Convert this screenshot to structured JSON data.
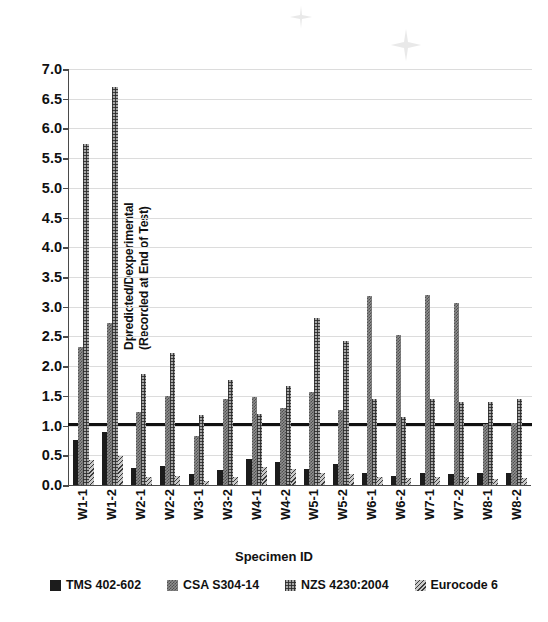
{
  "chart_data": {
    "type": "bar",
    "title": "",
    "xlabel": "Specimen ID",
    "ylabel": "Dpredicted/Dexperimental\n(Recorded at End of Test)",
    "ylim": [
      0.0,
      7.0
    ],
    "ytick_step": 0.5,
    "yticks": [
      "0.0",
      "0.5",
      "1.0",
      "1.5",
      "2.0",
      "2.5",
      "3.0",
      "3.5",
      "4.0",
      "4.5",
      "5.0",
      "5.5",
      "6.0",
      "6.5",
      "7.0"
    ],
    "grid": true,
    "legend_position": "bottom",
    "reference_line": {
      "value": 1.0,
      "color": "#111111"
    },
    "categories": [
      "W1-1",
      "W1-2",
      "W2-1",
      "W2-2",
      "W3-1",
      "W3-2",
      "W4-1",
      "W4-2",
      "W5-1",
      "W5-2",
      "W6-1",
      "W6-2",
      "W7-1",
      "W7-2",
      "W8-1",
      "W8-2"
    ],
    "series": [
      {
        "name": "TMS 402-602",
        "pattern": "solid-black",
        "values": [
          0.76,
          0.89,
          0.28,
          0.32,
          0.18,
          0.26,
          0.43,
          0.39,
          0.27,
          0.36,
          0.2,
          0.16,
          0.21,
          0.19,
          0.21,
          0.21
        ]
      },
      {
        "name": "CSA S304-14",
        "pattern": "checker-grey",
        "values": [
          2.33,
          2.72,
          1.23,
          1.5,
          0.83,
          1.44,
          1.48,
          1.3,
          1.57,
          1.27,
          3.18,
          2.52,
          3.19,
          3.06,
          1.02,
          1.04
        ]
      },
      {
        "name": "NZS 4230:2004",
        "pattern": "grid-grey",
        "values": [
          5.74,
          6.7,
          1.87,
          2.22,
          1.17,
          1.76,
          1.19,
          1.67,
          2.81,
          2.43,
          1.44,
          1.15,
          1.44,
          1.4,
          1.4,
          1.45
        ]
      },
      {
        "name": "Eurocode 6",
        "pattern": "diagonal-hatch",
        "values": [
          0.42,
          0.48,
          0.14,
          0.15,
          0.07,
          0.14,
          0.3,
          0.27,
          0.2,
          0.19,
          0.14,
          0.12,
          0.14,
          0.13,
          0.1,
          0.11
        ]
      }
    ]
  }
}
